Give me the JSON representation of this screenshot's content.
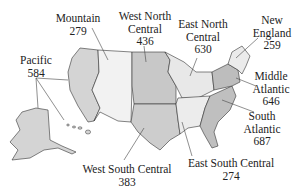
{
  "figure": {
    "type": "choropleth-map"
  },
  "regions": [
    {
      "id": "pacific",
      "name": "Pacific",
      "value": "584",
      "fill": "#d4d4d4"
    },
    {
      "id": "mountain",
      "name": "Mountain",
      "value": "279",
      "fill": "#f2f2f2"
    },
    {
      "id": "west-north-central",
      "name_line1": "West North",
      "name_line2": "Central",
      "value": "436",
      "fill": "#c8c8c8"
    },
    {
      "id": "east-north-central",
      "name_line1": "East North",
      "name_line2": "Central",
      "value": "630",
      "fill": "#e8e8e8"
    },
    {
      "id": "new-england",
      "name_line1": "New",
      "name_line2": "England",
      "value": "259",
      "fill": "#ebebeb"
    },
    {
      "id": "middle-atlantic",
      "name_line1": "Middle",
      "name_line2": "Atlantic",
      "value": "646",
      "fill": "#bdbdbd"
    },
    {
      "id": "south-atlantic",
      "name_line1": "South",
      "name_line2": "Atlantic",
      "value": "687",
      "fill": "#bfbfbf"
    },
    {
      "id": "east-south-central",
      "name": "East South Central",
      "value": "274",
      "fill": "#ececec"
    },
    {
      "id": "west-south-central",
      "name": "West South Central",
      "value": "383",
      "fill": "#cdcdcd"
    }
  ],
  "colors": {
    "border": "#333333",
    "division_border": "#111111",
    "leader": "#444444"
  }
}
